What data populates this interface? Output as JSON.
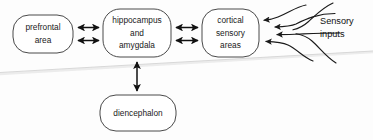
{
  "diagram": {
    "type": "block-diagram",
    "background_color": "#fdfdfd",
    "stroke_color": "#4a4a4a",
    "arrow_color": "#111111",
    "nodes": [
      {
        "id": "prefrontal",
        "label_lines": [
          "prefrontal",
          "area"
        ],
        "line1": "prefrontal",
        "line2": "area",
        "shape": "rounded-rectangle",
        "x": 13,
        "y": 15,
        "w": 60,
        "h": 38
      },
      {
        "id": "hippocampus",
        "label_lines": [
          "hippocampus",
          "and",
          "amygdala"
        ],
        "line1": "hippocampus",
        "line2": "and",
        "line3": "amygdala",
        "shape": "rounded-rectangle",
        "x": 103,
        "y": 9,
        "w": 68,
        "h": 48
      },
      {
        "id": "cortical",
        "label_lines": [
          "cortical",
          "sensory",
          "areas"
        ],
        "line1": "cortical",
        "line2": "sensory",
        "line3": "areas",
        "shape": "rounded-rectangle",
        "x": 202,
        "y": 9,
        "w": 57,
        "h": 48
      },
      {
        "id": "diencephalon",
        "label_lines": [
          "diencephalon"
        ],
        "line1": "diencephalon",
        "shape": "rounded-rectangle",
        "x": 100,
        "y": 95,
        "w": 76,
        "h": 36
      }
    ],
    "connectors": [
      {
        "id": "prefrontal-hippocampus-upper",
        "from": "prefrontal",
        "to": "hippocampus",
        "style": "double-headed-arrow",
        "orientation": "horizontal"
      },
      {
        "id": "prefrontal-hippocampus-lower",
        "from": "prefrontal",
        "to": "hippocampus",
        "style": "double-headed-arrow",
        "orientation": "horizontal"
      },
      {
        "id": "hippocampus-cortical-upper",
        "from": "hippocampus",
        "to": "cortical",
        "style": "double-headed-arrow",
        "orientation": "horizontal"
      },
      {
        "id": "hippocampus-cortical-lower",
        "from": "hippocampus",
        "to": "cortical",
        "style": "double-headed-arrow",
        "orientation": "horizontal"
      },
      {
        "id": "hippocampus-diencephalon",
        "from": "hippocampus",
        "to": "diencephalon",
        "style": "double-headed-arrow",
        "orientation": "vertical"
      }
    ],
    "sensory": {
      "caption_line1": "Sensory",
      "caption_line2": "inputs",
      "arrow_count": 4,
      "target": "cortical",
      "direction": "right-to-left"
    },
    "artifacts": {
      "scan_fold": "diagonal light gray scan fold line"
    }
  }
}
